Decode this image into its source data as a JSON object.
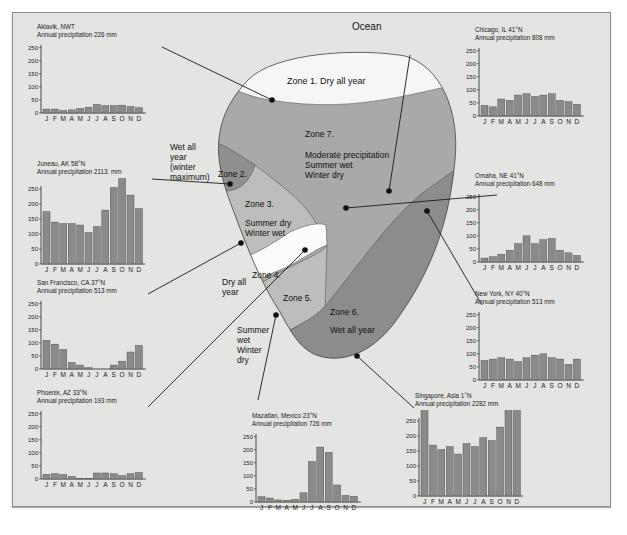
{
  "diagram": {
    "title_ocean": "Ocean",
    "zones": [
      {
        "id": 1,
        "label": "Zone 1.  Dry all year",
        "fill": "#f6f6f4"
      },
      {
        "id": 2,
        "label": "Zone 2.",
        "side_note": [
          "Wet all",
          "year",
          "(winter",
          "maximum)"
        ],
        "fill": "#8f8f8d"
      },
      {
        "id": 3,
        "label": "Zone 3.",
        "desc": [
          "Summer dry",
          "Winter wet"
        ],
        "fill": "#bdbdbb"
      },
      {
        "id": 4,
        "label": "Zone 4.",
        "side_note": [
          "Dry all",
          "year"
        ],
        "fill": "#fbfbfa"
      },
      {
        "id": 5,
        "label": "Zone 5.",
        "side_note": [
          "Summer",
          "wet",
          "Winter",
          "dry"
        ],
        "fill": "#bdbdbb"
      },
      {
        "id": 6,
        "label": "Zone 6.",
        "desc": [
          "Wet all year"
        ],
        "fill": "#8c8c8a"
      },
      {
        "id": 7,
        "label": "Zone 7.",
        "desc": [
          "Moderate precipitation",
          "Summer wet",
          "Winter dry"
        ],
        "fill": "#a9a9a7"
      }
    ],
    "colors": {
      "panel": "#e4e4e2",
      "bar": "#8a8a88",
      "line": "#1a1a1a"
    }
  },
  "months": [
    "J",
    "F",
    "M",
    "A",
    "M",
    "J",
    "J",
    "A",
    "S",
    "O",
    "N",
    "D"
  ],
  "chart_data": [
    {
      "type": "bar",
      "title": "Aklavik, NWT",
      "subtitle": "Annual precipitation 226 mm",
      "categories": [
        "J",
        "F",
        "M",
        "A",
        "M",
        "J",
        "J",
        "A",
        "S",
        "O",
        "N",
        "D"
      ],
      "values": [
        15,
        15,
        10,
        12,
        17,
        22,
        33,
        28,
        28,
        30,
        25,
        20
      ],
      "ylim": [
        0,
        250
      ],
      "yticks": [
        0,
        50,
        100,
        150,
        200,
        250
      ],
      "ylabel": "",
      "xlabel": "",
      "grid": false
    },
    {
      "type": "bar",
      "title": "Juneau, AK 58°N",
      "subtitle": "Annual precipitation 2113. mm",
      "categories": [
        "J",
        "F",
        "M",
        "A",
        "M",
        "J",
        "J",
        "A",
        "S",
        "O",
        "N",
        "D"
      ],
      "values": [
        175,
        140,
        135,
        135,
        130,
        105,
        125,
        180,
        255,
        290,
        230,
        185
      ],
      "ylim": [
        0,
        250
      ],
      "yticks": [
        0,
        50,
        100,
        150,
        200,
        250
      ],
      "ylabel": "",
      "xlabel": "",
      "grid": false
    },
    {
      "type": "bar",
      "title": "San Francisco, CA 37°N",
      "subtitle": "Annual precipitation 513 mm",
      "categories": [
        "J",
        "F",
        "M",
        "A",
        "M",
        "J",
        "J",
        "A",
        "S",
        "O",
        "N",
        "D"
      ],
      "values": [
        110,
        95,
        75,
        25,
        15,
        5,
        0,
        0,
        15,
        30,
        65,
        90
      ],
      "ylim": [
        0,
        250
      ],
      "yticks": [
        0,
        50,
        100,
        150,
        200,
        250
      ],
      "ylabel": "",
      "xlabel": "",
      "grid": false
    },
    {
      "type": "bar",
      "title": "Phoenix, AZ 33°N",
      "subtitle": "Annual precipitation 193 mm",
      "categories": [
        "J",
        "F",
        "M",
        "A",
        "M",
        "J",
        "J",
        "A",
        "S",
        "O",
        "N",
        "D"
      ],
      "values": [
        18,
        20,
        17,
        10,
        3,
        2,
        23,
        23,
        20,
        13,
        20,
        25
      ],
      "ylim": [
        0,
        250
      ],
      "yticks": [
        0,
        50,
        100,
        150,
        200,
        250
      ],
      "ylabel": "",
      "xlabel": "",
      "grid": false
    },
    {
      "type": "bar",
      "title": "Chicago, IL 41°N",
      "subtitle": "Annual precipitation 808 mm",
      "categories": [
        "J",
        "F",
        "M",
        "A",
        "M",
        "J",
        "J",
        "A",
        "S",
        "O",
        "N",
        "D"
      ],
      "values": [
        40,
        35,
        65,
        60,
        80,
        85,
        75,
        80,
        85,
        60,
        55,
        45
      ],
      "ylim": [
        0,
        250
      ],
      "yticks": [
        0,
        50,
        100,
        150,
        200,
        250
      ],
      "ylabel": "",
      "xlabel": "",
      "grid": false
    },
    {
      "type": "bar",
      "title": "Omaha, NE 41°N",
      "subtitle": "Annual precipitation 648 mm",
      "categories": [
        "J",
        "F",
        "M",
        "A",
        "M",
        "J",
        "J",
        "A",
        "S",
        "O",
        "N",
        "D"
      ],
      "values": [
        15,
        20,
        30,
        45,
        70,
        100,
        70,
        85,
        90,
        45,
        35,
        25
      ],
      "ylim": [
        0,
        250
      ],
      "yticks": [
        0,
        50,
        100,
        150,
        200,
        250
      ],
      "ylabel": "",
      "xlabel": "",
      "grid": false
    },
    {
      "type": "bar",
      "title": "New York, NY 40°N",
      "subtitle": "Annual precipitation 513 mm",
      "categories": [
        "J",
        "F",
        "M",
        "A",
        "M",
        "J",
        "J",
        "A",
        "S",
        "O",
        "N",
        "D"
      ],
      "values": [
        75,
        80,
        85,
        80,
        70,
        85,
        95,
        100,
        85,
        80,
        60,
        80
      ],
      "ylim": [
        0,
        250
      ],
      "yticks": [
        0,
        50,
        100,
        150,
        200,
        250
      ],
      "ylabel": "",
      "xlabel": "",
      "grid": false
    },
    {
      "type": "bar",
      "title": "Mazatlan, Mexico 23°N",
      "subtitle": "Annual precipitation 726 mm",
      "categories": [
        "J",
        "F",
        "M",
        "A",
        "M",
        "J",
        "J",
        "A",
        "S",
        "O",
        "N",
        "D"
      ],
      "values": [
        20,
        15,
        8,
        7,
        10,
        35,
        155,
        210,
        190,
        65,
        25,
        22
      ],
      "ylim": [
        0,
        250
      ],
      "yticks": [
        0,
        50,
        100,
        150,
        200,
        250
      ],
      "ylabel": "",
      "xlabel": "",
      "grid": false
    },
    {
      "type": "bar",
      "title": "Singapore, Asia 1°N",
      "subtitle": "Annual precipitation 2282 mm",
      "categories": [
        "J",
        "F",
        "M",
        "A",
        "M",
        "J",
        "J",
        "A",
        "S",
        "O",
        "N",
        "D"
      ],
      "values": [
        290,
        170,
        155,
        165,
        140,
        175,
        165,
        195,
        185,
        230,
        290,
        305
      ],
      "ylim": [
        0,
        250
      ],
      "yticks": [
        0,
        50,
        100,
        150,
        200,
        250
      ],
      "ylabel": "",
      "xlabel": "",
      "grid": false
    }
  ]
}
